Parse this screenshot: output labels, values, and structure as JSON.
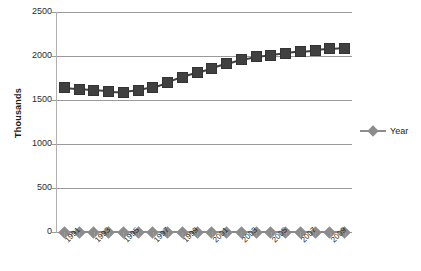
{
  "chart_data": {
    "type": "scatter",
    "title": "",
    "xlabel": "",
    "ylabel": "Thousands",
    "ylim": [
      0,
      2500
    ],
    "yticks": [
      0,
      500,
      1000,
      1500,
      2000,
      2500
    ],
    "ytick_labels": [
      "0",
      "500",
      "1000",
      "1500",
      "2000",
      "2500"
    ],
    "grid": true,
    "legend_position": "right",
    "x": [
      1991,
      1992,
      1993,
      1994,
      1995,
      1996,
      1997,
      1998,
      1999,
      2000,
      2001,
      2002,
      2003,
      2004,
      2005,
      2006,
      2007,
      2008,
      2009,
      2010
    ],
    "xtick_labels": [
      "1991",
      "",
      "1993",
      "",
      "1995",
      "",
      "1997",
      "",
      "1999",
      "",
      "2001",
      "",
      "2003",
      "",
      "2005",
      "",
      "2007",
      "",
      "2009",
      ""
    ],
    "xtick_labels_shown": [
      "1991",
      "1993",
      "1995",
      "1997",
      "1999",
      "2001",
      "2003",
      "2005",
      "2007",
      "2009"
    ],
    "series": [
      {
        "name": "Value",
        "marker": "square",
        "color": "#404040",
        "values": [
          1640,
          1625,
          1610,
          1595,
          1590,
          1610,
          1640,
          1700,
          1760,
          1810,
          1860,
          1910,
          1960,
          1990,
          2010,
          2030,
          2050,
          2065,
          2080,
          2090
        ]
      },
      {
        "name": "Year",
        "marker": "diamond",
        "color": "#8c8c8c",
        "values": [
          0,
          0,
          0,
          0,
          0,
          0,
          0,
          0,
          0,
          0,
          0,
          0,
          0,
          0,
          0,
          0,
          0,
          0,
          0,
          0
        ]
      }
    ],
    "legend": [
      {
        "label": "Year",
        "marker": "diamond",
        "color": "#8c8c8c"
      }
    ]
  }
}
